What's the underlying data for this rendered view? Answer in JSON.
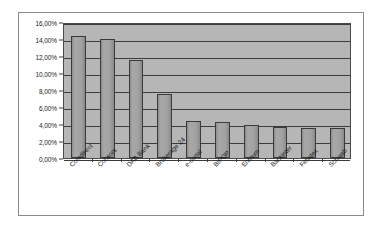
{
  "chart_data": {
    "type": "bar",
    "title": "",
    "xlabel": "",
    "ylabel": "",
    "ylim": [
      0,
      16
    ],
    "grid": true,
    "legend": "none",
    "axis_number_format": "comma-decimal-percent",
    "categories": [
      "Comdirect",
      "Consors",
      "DAB Bank",
      "Brokerage 24",
      "e-cortal",
      "BIPOP",
      "Entrium",
      "Bankinter",
      "Fimatex",
      "Schwab"
    ],
    "values": [
      14.3,
      14.0,
      11.5,
      7.5,
      4.3,
      4.2,
      3.9,
      3.7,
      3.5,
      3.5
    ],
    "value_labels": [
      "14,30%",
      "14,00%",
      "11,50%",
      "7,50%",
      "4,30%",
      "4,20%",
      "3,90%",
      "3,70%",
      "3,50%",
      "3,50%"
    ],
    "y_ticks": [
      0,
      2,
      4,
      6,
      8,
      10,
      12,
      14,
      16
    ],
    "y_tick_labels": [
      "0,00%",
      "2,00%",
      "4,00%",
      "6,00%",
      "8,00%",
      "10,00%",
      "12,00%",
      "14,00%",
      "16,00%"
    ],
    "colors": {
      "bar_fill": "#9a9a9a",
      "bar_border": "#3a3a3a",
      "plot_background": "#b6b6b6",
      "gridline": "#3c3c3c",
      "chart_background": "#ffffff",
      "frame_border": "#8a8a8a",
      "text": "#1a1a1a"
    }
  }
}
